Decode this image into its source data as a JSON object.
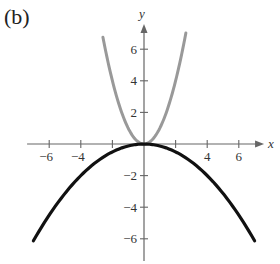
{
  "panel_label": "(b)",
  "chart_data": {
    "type": "line",
    "title": "",
    "xlabel": "x",
    "ylabel": "y",
    "xlim": [
      -7.4,
      7.6
    ],
    "ylim": [
      -7.4,
      7.6
    ],
    "grid": false,
    "legend": null,
    "x_ticks": [
      -6,
      -4,
      -2,
      2,
      4,
      6
    ],
    "x_tick_labels": [
      "−6",
      "−4",
      "",
      "",
      "4",
      "6"
    ],
    "y_ticks": [
      -6,
      -4,
      -2,
      2,
      4,
      6
    ],
    "y_tick_labels": [
      "−6",
      "−4",
      "−2",
      "2",
      "4",
      "6"
    ],
    "series": [
      {
        "name": "gray parabola (y = x²)",
        "color": "#999999",
        "x": [
          -2.6,
          -2,
          -1.5,
          -1,
          -0.5,
          0,
          0.5,
          1,
          1.5,
          2,
          2.65
        ],
        "y": [
          6.76,
          4,
          2.25,
          1,
          0.25,
          0,
          0.25,
          1,
          2.25,
          4,
          7.02
        ]
      },
      {
        "name": "black parabola (y = -x²/8)",
        "color": "#111111",
        "x": [
          -7,
          -6,
          -5,
          -4,
          -3,
          -2,
          -1,
          0,
          1,
          2,
          3,
          4,
          5,
          6,
          7
        ],
        "y": [
          -6.125,
          -4.5,
          -3.125,
          -2,
          -1.125,
          -0.5,
          -0.125,
          0,
          -0.125,
          -0.5,
          -1.125,
          -2,
          -3.125,
          -4.5,
          -6.125
        ]
      }
    ]
  },
  "layout": {
    "origin_px": [
      144,
      144
    ],
    "unit_px": 15.8
  }
}
